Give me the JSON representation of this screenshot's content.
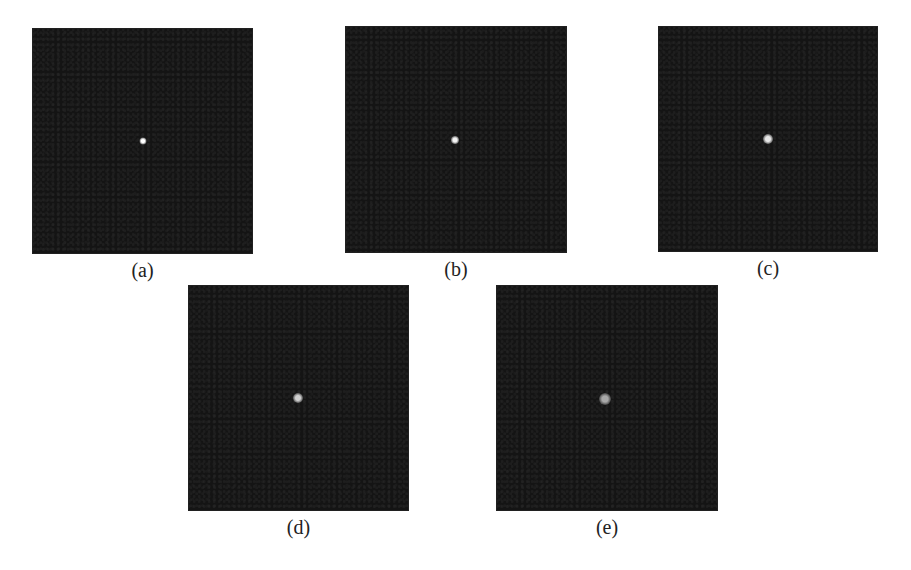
{
  "figure": {
    "panels": [
      {
        "id": "a",
        "label": "(a)",
        "x": 32,
        "y": 28,
        "w": 221,
        "h": 226,
        "dot": {
          "cx": 111,
          "cy": 113,
          "size": 7,
          "core": "#ffffff",
          "halo": "rgba(255,255,255,0.35)"
        }
      },
      {
        "id": "b",
        "label": "(b)",
        "x": 345,
        "y": 26,
        "w": 222,
        "h": 227,
        "dot": {
          "cx": 110,
          "cy": 114,
          "size": 8,
          "core": "#f4f4f4",
          "halo": "rgba(240,240,240,0.35)"
        }
      },
      {
        "id": "c",
        "label": "(c)",
        "x": 658,
        "y": 26,
        "w": 220,
        "h": 226,
        "dot": {
          "cx": 110,
          "cy": 113,
          "size": 10,
          "core": "#e8e8e8",
          "halo": "rgba(220,220,220,0.35)"
        }
      },
      {
        "id": "d",
        "label": "(d)",
        "x": 188,
        "y": 285,
        "w": 221,
        "h": 226,
        "dot": {
          "cx": 110,
          "cy": 113,
          "size": 10,
          "core": "#cfcfcf",
          "halo": "rgba(190,190,190,0.35)"
        }
      },
      {
        "id": "e",
        "label": "(e)",
        "x": 496,
        "y": 285,
        "w": 222,
        "h": 226,
        "dot": {
          "cx": 109,
          "cy": 114,
          "size": 12,
          "core": "#a8a8a8",
          "halo": "rgba(150,150,150,0.35)"
        }
      }
    ],
    "background_color": "#141414"
  }
}
